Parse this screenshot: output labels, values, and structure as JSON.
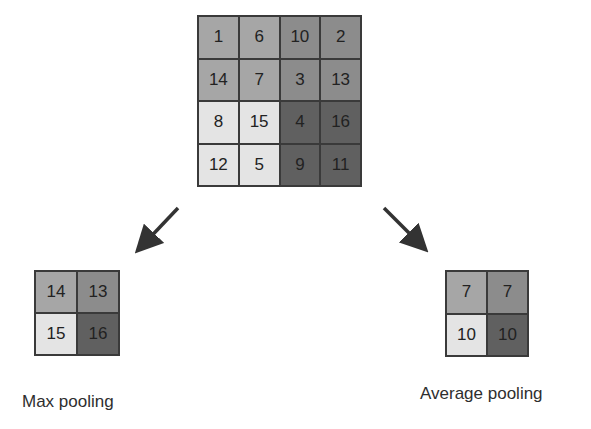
{
  "input_grid": {
    "rows": [
      [
        {
          "v": "1",
          "c": "#a6a6a6"
        },
        {
          "v": "6",
          "c": "#a6a6a6"
        },
        {
          "v": "10",
          "c": "#8c8c8c"
        },
        {
          "v": "2",
          "c": "#8c8c8c"
        }
      ],
      [
        {
          "v": "14",
          "c": "#a6a6a6"
        },
        {
          "v": "7",
          "c": "#a6a6a6"
        },
        {
          "v": "3",
          "c": "#8c8c8c"
        },
        {
          "v": "13",
          "c": "#8c8c8c"
        }
      ],
      [
        {
          "v": "8",
          "c": "#e4e4e4"
        },
        {
          "v": "15",
          "c": "#e4e4e4"
        },
        {
          "v": "4",
          "c": "#606060"
        },
        {
          "v": "16",
          "c": "#606060"
        }
      ],
      [
        {
          "v": "12",
          "c": "#e4e4e4"
        },
        {
          "v": "5",
          "c": "#e4e4e4"
        },
        {
          "v": "9",
          "c": "#606060"
        },
        {
          "v": "11",
          "c": "#606060"
        }
      ]
    ]
  },
  "max_pooling": {
    "label": "Max pooling",
    "rows": [
      [
        {
          "v": "14",
          "c": "#a6a6a6"
        },
        {
          "v": "13",
          "c": "#8c8c8c"
        }
      ],
      [
        {
          "v": "15",
          "c": "#e4e4e4"
        },
        {
          "v": "16",
          "c": "#606060"
        }
      ]
    ]
  },
  "average_pooling": {
    "label": "Average pooling",
    "rows": [
      [
        {
          "v": "7",
          "c": "#a6a6a6"
        },
        {
          "v": "7",
          "c": "#8c8c8c"
        }
      ],
      [
        {
          "v": "10",
          "c": "#e4e4e4"
        },
        {
          "v": "10",
          "c": "#606060"
        }
      ]
    ]
  },
  "arrows": [
    {
      "name": "arrow-to-max",
      "from": [
        178,
        208
      ],
      "to": [
        137,
        252
      ]
    },
    {
      "name": "arrow-to-avg",
      "from": [
        384,
        208
      ],
      "to": [
        426,
        251
      ]
    }
  ],
  "colors": {
    "border": "#3a3a3a",
    "arrow": "#333333"
  }
}
